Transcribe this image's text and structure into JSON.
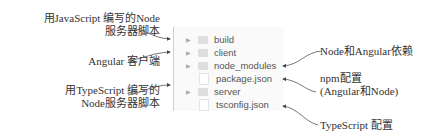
{
  "diagram": {
    "left_labels": [
      {
        "line1": "用JavaScript 编写的Node",
        "line2": "服务器脚本"
      },
      {
        "line1": "Angular 客户端"
      },
      {
        "line1": "用TypeScript 编写的",
        "line2": "Node服务器脚本"
      }
    ],
    "right_labels": [
      {
        "line1": "Node和Angular依赖"
      },
      {
        "line1": "npm配置",
        "line2": "(Angular和Node)"
      },
      {
        "line1": "TypeScript 配置"
      }
    ],
    "files": [
      {
        "name": "build",
        "type": "folder"
      },
      {
        "name": "client",
        "type": "folder"
      },
      {
        "name": "node_modules",
        "type": "folder"
      },
      {
        "name": "package.json",
        "type": "file"
      },
      {
        "name": "server",
        "type": "folder"
      },
      {
        "name": "tsconfig.json",
        "type": "file"
      }
    ],
    "colors": {
      "panel_bg": "#fafafa",
      "folder": "#dedede",
      "arrow": "#444444"
    }
  }
}
